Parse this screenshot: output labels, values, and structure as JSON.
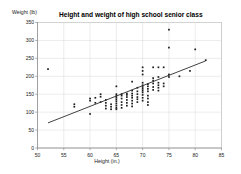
{
  "chart_data": {
    "type": "scatter",
    "title": "Height and weight of high school senior class",
    "xlabel": "Height (in.)",
    "ylabel": "Weight (lb)",
    "xlim": [
      50,
      85
    ],
    "ylim": [
      0,
      350
    ],
    "xticks": [
      50,
      55,
      60,
      65,
      70,
      75,
      80,
      85
    ],
    "yticks": [
      0,
      50,
      100,
      150,
      200,
      250,
      300,
      350
    ],
    "grid": true,
    "legend": "none",
    "point_color": "#1c1c1c",
    "line_color": "#2b2b2b",
    "series": [
      {
        "name": "Students",
        "points": [
          [
            52,
            220
          ],
          [
            57,
            122
          ],
          [
            57,
            115
          ],
          [
            60,
            95
          ],
          [
            60,
            132
          ],
          [
            60,
            138
          ],
          [
            61,
            140
          ],
          [
            61,
            126
          ],
          [
            62,
            143
          ],
          [
            62,
            150
          ],
          [
            62,
            128
          ],
          [
            63,
            118
          ],
          [
            63,
            126
          ],
          [
            63,
            110
          ],
          [
            63,
            134
          ],
          [
            64,
            122
          ],
          [
            64,
            108
          ],
          [
            64,
            115
          ],
          [
            65,
            172
          ],
          [
            65,
            145
          ],
          [
            65,
            150
          ],
          [
            65,
            140
          ],
          [
            65,
            135
          ],
          [
            65,
            130
          ],
          [
            65,
            124
          ],
          [
            65,
            118
          ],
          [
            65,
            112
          ],
          [
            65,
            108
          ],
          [
            66,
            150
          ],
          [
            66,
            146
          ],
          [
            66,
            138
          ],
          [
            66,
            128
          ],
          [
            66,
            120
          ],
          [
            66,
            112
          ],
          [
            67,
            152
          ],
          [
            67,
            148
          ],
          [
            67,
            142
          ],
          [
            67,
            134
          ],
          [
            67,
            126
          ],
          [
            67,
            118
          ],
          [
            68,
            185
          ],
          [
            68,
            160
          ],
          [
            68,
            152
          ],
          [
            68,
            146
          ],
          [
            68,
            140
          ],
          [
            68,
            132
          ],
          [
            68,
            124
          ],
          [
            68,
            116
          ],
          [
            69,
            168
          ],
          [
            69,
            158
          ],
          [
            69,
            150
          ],
          [
            69,
            142
          ],
          [
            69,
            136
          ],
          [
            69,
            128
          ],
          [
            70,
            225
          ],
          [
            70,
            215
          ],
          [
            70,
            205
          ],
          [
            70,
            182
          ],
          [
            70,
            175
          ],
          [
            70,
            170
          ],
          [
            70,
            165
          ],
          [
            70,
            160
          ],
          [
            70,
            155
          ],
          [
            70,
            148
          ],
          [
            70,
            140
          ],
          [
            70,
            132
          ],
          [
            71,
            178
          ],
          [
            71,
            172
          ],
          [
            71,
            165
          ],
          [
            71,
            158
          ],
          [
            71,
            146
          ],
          [
            71,
            138
          ],
          [
            71,
            128
          ],
          [
            71,
            120
          ],
          [
            72,
            225
          ],
          [
            72,
            195
          ],
          [
            72,
            188
          ],
          [
            72,
            180
          ],
          [
            72,
            170
          ],
          [
            72,
            162
          ],
          [
            73,
            225
          ],
          [
            73,
            198
          ],
          [
            73,
            182
          ],
          [
            73,
            175
          ],
          [
            73,
            168
          ],
          [
            73,
            160
          ],
          [
            74,
            225
          ],
          [
            74,
            180
          ],
          [
            74,
            172
          ],
          [
            75,
            330
          ],
          [
            75,
            280
          ],
          [
            75,
            205
          ],
          [
            75,
            198
          ],
          [
            77,
            200
          ],
          [
            79,
            215
          ],
          [
            80,
            275
          ],
          [
            82,
            245
          ]
        ]
      }
    ],
    "trendline": {
      "name": "Linear fit",
      "x_start": 52,
      "y_start": 70,
      "x_end": 82,
      "y_end": 243
    }
  }
}
